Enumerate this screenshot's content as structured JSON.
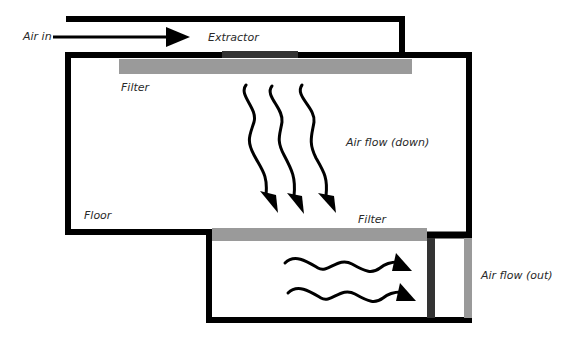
{
  "diagram": {
    "labels": {
      "air_in": "Air in",
      "extractor": "Extractor",
      "filter_top": "Filter",
      "air_flow_down": "Air flow (down)",
      "floor": "Floor",
      "filter_bottom": "Filter",
      "air_flow_out": "Air flow (out)"
    },
    "colors": {
      "wall": "#000000",
      "filter": "#9a9a9a",
      "extractor_slot": "#333333",
      "outlet_filter": "#9a9a9a",
      "text": "#2a2a2a",
      "background": "#ffffff"
    },
    "components": {
      "down_arrows": 3,
      "out_arrows": 2
    }
  }
}
